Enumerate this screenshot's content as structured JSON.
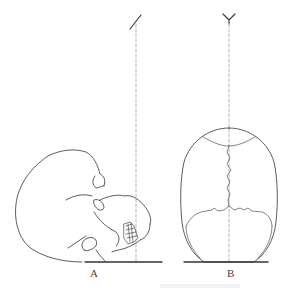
{
  "figure": {
    "panels": [
      {
        "id": "A",
        "label": "A",
        "view": "skull tilted back (lateral view) with plumb line"
      },
      {
        "id": "B",
        "label": "B",
        "view": "skull top view (vertex) with midline"
      }
    ],
    "colors": {
      "line": "#333333",
      "dashed_line": "#9a9a9a",
      "ground": "#333333",
      "background": "#ffffff"
    }
  }
}
